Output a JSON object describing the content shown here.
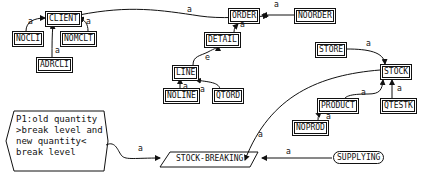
{
  "diagram": {
    "entities": {
      "client": "CLIENT",
      "nocli": "NOCLI",
      "nomclt": "NOMCLT",
      "adrcli": "ADRCLI",
      "order": "ORDER",
      "noorder": "NOORDER",
      "detail": "DETAIL",
      "line": "LINE",
      "noline": "NOLINE",
      "qtord": "QTORD",
      "store": "STORE",
      "stock": "STOCK",
      "product": "PRODUCT",
      "qtestk": "QTESTK",
      "noprod": "NOPROD"
    },
    "events": {
      "stock_breaking": "STOCK-BREAKING",
      "supplying": "SUPPLYING"
    },
    "predicate": {
      "lines": [
        "P1:old quantity",
        ">break level and",
        "new quantity<",
        "break level"
      ]
    },
    "edge_labels": {
      "a": "a",
      "e": "e"
    }
  }
}
